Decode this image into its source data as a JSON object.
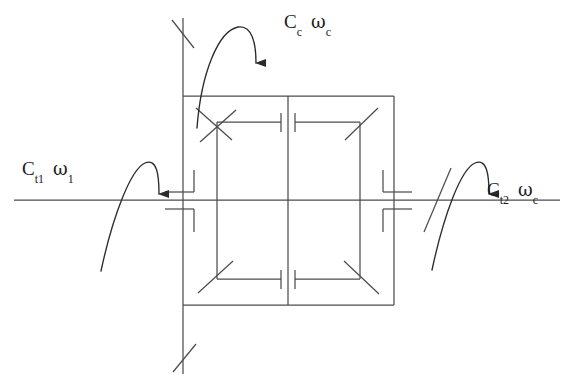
{
  "figure": {
    "type": "mechanical-schematic",
    "background_color": "#ffffff",
    "line_color": "#4d4d4d",
    "text_color": "#1b1b1b"
  },
  "labels": {
    "carrier": {
      "id": "carrier-torque-label",
      "torque_symbol": "C",
      "torque_subscript": "c",
      "speed_symbol": "ω",
      "speed_subscript": "c",
      "text": "C_c  ω_c",
      "position": "top"
    },
    "input": {
      "id": "input-torque-label",
      "torque_symbol": "C",
      "torque_subscript": "t1",
      "speed_symbol": "ω",
      "speed_subscript": "1",
      "text": "C_t1  ω_1",
      "position": "left"
    },
    "output": {
      "id": "output-torque-label",
      "torque_symbol": "C",
      "torque_subscript": "t2",
      "speed_symbol": "ω",
      "speed_subscript": "c",
      "text": "C_t2  ω_c",
      "position": "right"
    }
  },
  "arrows": {
    "carrier_arrow": {
      "name": "carrier-torque-arrow",
      "direction": "clockwise-down",
      "head": "filled-triangle"
    },
    "input_arrow": {
      "name": "input-torque-arrow",
      "direction": "clockwise-down",
      "head": "filled-triangle"
    },
    "output_arrow": {
      "name": "output-torque-arrow",
      "direction": "clockwise-down",
      "head": "filled-triangle"
    }
  },
  "components": {
    "carrier_box": {
      "name": "planet-carrier-box",
      "x": 183,
      "y": 96,
      "width": 211,
      "height": 209
    },
    "vertical_shaft": {
      "name": "carrier-vertical-shaft",
      "x": 183,
      "top_y": 18,
      "bottom_y": 374,
      "break_marks": 2
    },
    "horizontal_shaft": {
      "name": "main-horizontal-shaft",
      "y": 200,
      "left_x": 14,
      "right_x": 560
    },
    "center_line": {
      "name": "gear-center-divider",
      "x": 288
    },
    "gear_shaft_left": {
      "name": "left-gear-shaft",
      "x": 217
    },
    "gear_shaft_right": {
      "name": "right-gear-shaft",
      "x": 360
    },
    "mesh_lines": 4,
    "bearing_hatches": 4
  }
}
